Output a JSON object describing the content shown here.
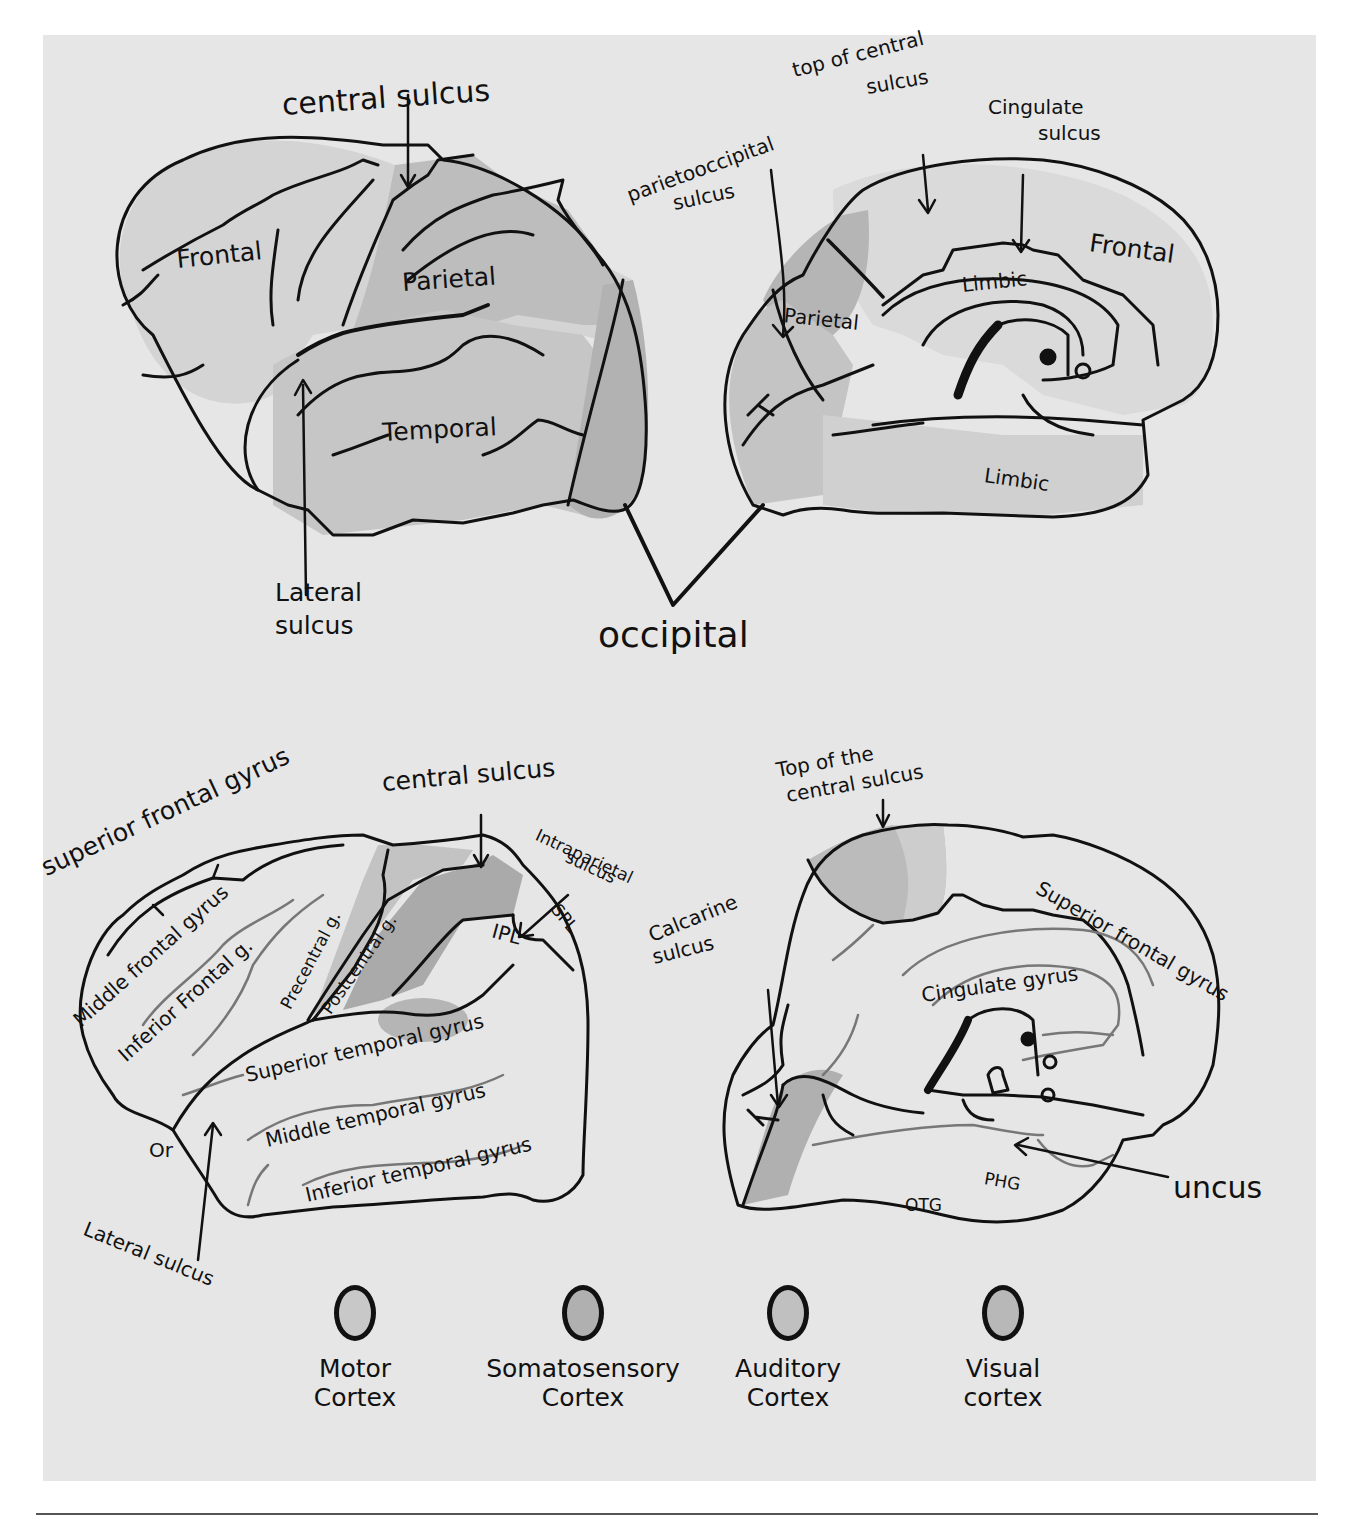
{
  "figure": {
    "colors": {
      "paper": "#e6e6e6",
      "ink": "#111111",
      "lobe_shade": "#c9c9c9",
      "dark_shade": "#a8a8a8",
      "light_shade": "#d8d8d8"
    }
  },
  "top_left": {
    "view": "lateral",
    "labels": {
      "central_sulcus": "central sulcus",
      "frontal": "Frontal",
      "parietal": "Parietal",
      "temporal": "Temporal",
      "lateral_sulcus_1": "Lateral",
      "lateral_sulcus_2": "sulcus"
    }
  },
  "top_right": {
    "view": "medial",
    "labels": {
      "top_central_1": "top of central",
      "top_central_2": "sulcus",
      "cingulate_1": "Cingulate",
      "cingulate_2": "sulcus",
      "parietooccipital_1": "parietooccipital",
      "parietooccipital_2": "sulcus",
      "frontal": "Frontal",
      "parietal": "Parietal",
      "limbic_upper": "Limbic",
      "limbic_lower": "Limbic"
    }
  },
  "shared": {
    "occipital": "occipital"
  },
  "bottom_left": {
    "view": "lateral-gyri",
    "labels": {
      "superior_frontal_gyrus": "superior frontal gyrus",
      "central_sulcus": "central sulcus",
      "intraparietal_1": "Intraparietal",
      "intraparietal_2": "sulcus",
      "middle_frontal_gyrus": "Middle frontal gyrus",
      "inferior_frontal_g": "Inferior Frontal g.",
      "precentral_g": "Precentral g.",
      "postcentral_g": "Postcentral g.",
      "ipl": "IPL",
      "spl": "SPL",
      "superior_temporal_gyrus": "Superior temporal gyrus",
      "middle_temporal_gyrus": "Middle temporal gyrus",
      "inferior_temporal_gyrus": "Inferior temporal gyrus",
      "or": "Or",
      "lateral_sulcus": "Lateral sulcus"
    }
  },
  "bottom_right": {
    "view": "medial-gyri",
    "labels": {
      "top_central_1": "Top of the",
      "top_central_2": "central sulcus",
      "calcarine_1": "Calcarine",
      "calcarine_2": "sulcus",
      "superior_frontal_gyrus": "Superior frontal gyrus",
      "cingulate_gyrus": "Cingulate gyrus",
      "phg": "PHG",
      "otg": "OTG",
      "uncus": "uncus"
    }
  },
  "legend": {
    "items": [
      {
        "label_1": "Motor",
        "label_2": "Cortex",
        "color": "#c8c8c8"
      },
      {
        "label_1": "Somatosensory",
        "label_2": "Cortex",
        "color": "#b0b0b0"
      },
      {
        "label_1": "Auditory",
        "label_2": "Cortex",
        "color": "#c0c0c0"
      },
      {
        "label_1": "Visual",
        "label_2": "cortex",
        "color": "#b8b8b8"
      }
    ]
  }
}
